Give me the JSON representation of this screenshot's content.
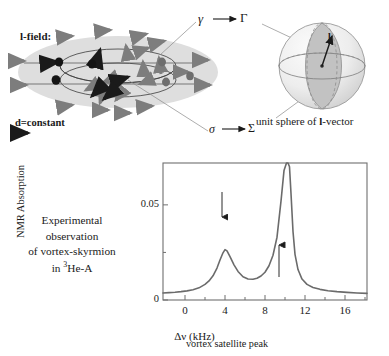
{
  "diagram": {
    "title_l_field": "l-field:",
    "d_constant": "d=constant",
    "gamma_small": "γ",
    "gamma_capital": "Γ",
    "sigma_small": "σ",
    "sigma_capital": "Σ",
    "unit_sphere_caption_pre": "unit sphere of ",
    "unit_sphere_caption_bold": "l",
    "unit_sphere_caption_post": "-vector",
    "l_vector_label": "l",
    "colors": {
      "disk_fill": "#dcdcdc",
      "arrow_gray": "#808080",
      "dot_dark": "#1a1a1a",
      "sphere_light": "#e8e8e8",
      "sphere_shade": "#bdbdbd",
      "line": "#555555"
    }
  },
  "caption": {
    "line1": "Experimental",
    "line2": "observation",
    "line3": "of vortex-skyrmion",
    "line4_pre": "in ",
    "line4_sup": "3",
    "line4_post": "He-A"
  },
  "chart_data": {
    "type": "line",
    "title": "",
    "xlabel": "Δν (kHz)",
    "ylabel": "NMR Absorption",
    "xticks": [
      0,
      4,
      8,
      12,
      16
    ],
    "xticklabels": [
      "0",
      "4",
      "8",
      "12",
      "16"
    ],
    "yticks": [
      0,
      0.05
    ],
    "yticklabels": [
      "0",
      "0.05"
    ],
    "xlim": [
      -2.2,
      18.2
    ],
    "ylim": [
      0,
      0.072
    ],
    "grid": false,
    "legend": null,
    "line_color": "#6b6b6b",
    "annotations": [
      {
        "text": "vortex satellite peak",
        "arrow": "down",
        "points_to_x": 4.0,
        "points_to_y": 0.0265
      },
      {
        "text": "main peak",
        "arrow": "up",
        "points_to_x": 9.5,
        "points_to_y": 0.041
      }
    ],
    "series": [
      {
        "name": "NMR absorption spectrum",
        "x": [
          -2.2,
          -1.6,
          -1.0,
          -0.4,
          0.2,
          0.8,
          1.4,
          2.0,
          2.4,
          2.8,
          3.2,
          3.5,
          3.8,
          4.0,
          4.2,
          4.5,
          4.9,
          5.3,
          5.8,
          6.3,
          6.8,
          7.2,
          7.6,
          8.0,
          8.4,
          8.8,
          9.2,
          9.6,
          9.9,
          10.15,
          10.3,
          10.45,
          10.6,
          10.8,
          11.0,
          11.3,
          11.7,
          12.2,
          12.8,
          13.5,
          14.3,
          15.2,
          16.2,
          17.2,
          18.2
        ],
        "y": [
          0.0037,
          0.0039,
          0.0041,
          0.0044,
          0.0048,
          0.0054,
          0.0064,
          0.0082,
          0.01,
          0.0127,
          0.0168,
          0.021,
          0.0248,
          0.0265,
          0.0258,
          0.0228,
          0.0185,
          0.015,
          0.0122,
          0.011,
          0.0109,
          0.0114,
          0.0126,
          0.0146,
          0.018,
          0.0235,
          0.033,
          0.052,
          0.068,
          0.072,
          0.072,
          0.07,
          0.056,
          0.036,
          0.024,
          0.016,
          0.011,
          0.0082,
          0.0066,
          0.0056,
          0.0049,
          0.0044,
          0.004,
          0.0037,
          0.0035
        ]
      }
    ]
  }
}
